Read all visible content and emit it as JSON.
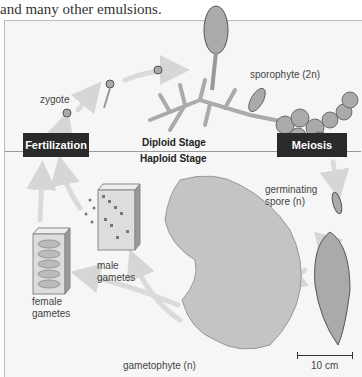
{
  "caption_text": "and many other emulsions.",
  "stages": {
    "diploid": "Diploid Stage",
    "haploid": "Haploid Stage"
  },
  "processes": {
    "fertilization": "Fertilization",
    "meiosis": "Meiosis"
  },
  "labels": {
    "zygote": "zygote",
    "sporophyte": "sporophyte (2n)",
    "germinating_spore_line1": "germinating",
    "germinating_spore_line2": "spore (n)",
    "male_gametes_line1": "male",
    "male_gametes_line2": "gametes",
    "female_gametes_line1": "female",
    "female_gametes_line2": "gametes",
    "gametophyte": "gametophyte (n)"
  },
  "scale_bar": {
    "label": "10 cm"
  },
  "colors": {
    "box": "#2a2a2a",
    "arrow": "#d8d8d8",
    "organism": "#b8b8b8",
    "cell_outline": "#666666"
  }
}
